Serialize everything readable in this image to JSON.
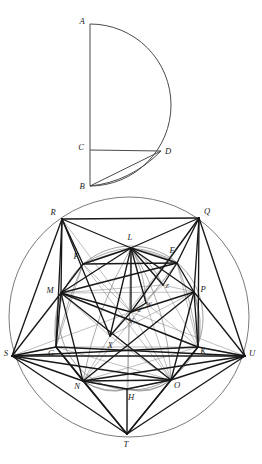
{
  "figure": {
    "colors": {
      "ink_heavy": "#1b1b1b",
      "ink_light": "#6b6b6b",
      "ink_mid": "#3a3a3a",
      "background": "#ffffff"
    }
  },
  "upper_figure": {
    "name": "semicircle-figure",
    "points": [
      {
        "id": "A",
        "label": "A",
        "x": 90,
        "y": 24,
        "label_x": 82,
        "label_y": 22
      },
      {
        "id": "C",
        "label": "C",
        "x": 90,
        "y": 150,
        "label_x": 81,
        "label_y": 148
      },
      {
        "id": "D",
        "label": "D",
        "x": 161,
        "y": 151,
        "label_x": 168,
        "label_y": 152
      },
      {
        "id": "B",
        "label": "B",
        "x": 90,
        "y": 186,
        "label_x": 82,
        "label_y": 187
      }
    ],
    "segments": [
      {
        "from": "A",
        "to": "B",
        "weight": "light"
      },
      {
        "from": "C",
        "to": "D",
        "weight": "light"
      },
      {
        "from": "B",
        "to": "D",
        "weight": "light"
      }
    ],
    "arcs": [
      {
        "name": "arc-A-to-B",
        "description": "semicircular arc from A through right extreme to B"
      },
      {
        "name": "arc-B-to-D",
        "description": "small arc from B up to D"
      }
    ]
  },
  "lower_figure": {
    "name": "circle-figure",
    "outer_circle": {
      "cx": 129,
      "cy": 317,
      "r": 120
    },
    "inner_circle": {
      "cx": 131,
      "cy": 318,
      "r": 72
    },
    "points": [
      {
        "id": "R",
        "label": "R",
        "x": 62,
        "y": 219,
        "label_x": 53,
        "label_y": 213
      },
      {
        "id": "Q",
        "label": "Q",
        "x": 199,
        "y": 218,
        "label_x": 207,
        "label_y": 212
      },
      {
        "id": "S",
        "label": "S",
        "x": 12,
        "y": 356,
        "label_x": 6,
        "label_y": 354
      },
      {
        "id": "U",
        "label": "U",
        "x": 245,
        "y": 356,
        "label_x": 251,
        "label_y": 354
      },
      {
        "id": "T",
        "label": "T",
        "x": 127,
        "y": 434,
        "label_x": 126,
        "label_y": 444
      },
      {
        "id": "L",
        "label": "L",
        "x": 131,
        "y": 248,
        "label_x": 129,
        "label_y": 238
      },
      {
        "id": "F",
        "label": "F",
        "x": 83,
        "y": 264,
        "label_x": 76,
        "label_y": 257
      },
      {
        "id": "E",
        "label": "E",
        "x": 177,
        "y": 263,
        "label_x": 170,
        "label_y": 251
      },
      {
        "id": "M",
        "label": "M",
        "x": 61,
        "y": 293,
        "label_x": 51,
        "label_y": 291
      },
      {
        "id": "P",
        "label": "P",
        "x": 194,
        "y": 292,
        "label_x": 202,
        "label_y": 290
      },
      {
        "id": "G",
        "label": "G",
        "x": 56,
        "y": 347,
        "label_x": 52,
        "label_y": 353
      },
      {
        "id": "K",
        "label": "K",
        "x": 198,
        "y": 347,
        "label_x": 201,
        "label_y": 351
      },
      {
        "id": "N",
        "label": "N",
        "x": 83,
        "y": 381,
        "label_x": 78,
        "label_y": 385
      },
      {
        "id": "O",
        "label": "O",
        "x": 171,
        "y": 380,
        "label_x": 176,
        "label_y": 385
      },
      {
        "id": "H",
        "label": "H",
        "x": 127,
        "y": 389,
        "label_x": 130,
        "label_y": 397
      },
      {
        "id": "V",
        "label": "V",
        "x": 131,
        "y": 312,
        "label_x": 131,
        "label_y": 321
      },
      {
        "id": "X",
        "label": "X",
        "x": 110,
        "y": 336,
        "label_x": 110,
        "label_y": 345
      },
      {
        "id": "W",
        "label": "W",
        "x": 146,
        "y": 303,
        "label_x": 147,
        "label_y": 305
      },
      {
        "id": "Z",
        "label": "Z",
        "x": 163,
        "y": 285,
        "label_x": 166,
        "label_y": 286
      },
      {
        "id": "a",
        "label": "a",
        "x": 139,
        "y": 309,
        "label_x": 138,
        "label_y": 310
      }
    ],
    "label_list": [
      "R",
      "Q",
      "L",
      "E",
      "F",
      "M",
      "P",
      "Z",
      "W",
      "a",
      "V",
      "X",
      "S",
      "G",
      "K",
      "U",
      "N",
      "O",
      "H",
      "T"
    ],
    "heavy_segments": [
      [
        "R",
        "Q"
      ],
      [
        "R",
        "M"
      ],
      [
        "R",
        "L"
      ],
      [
        "R",
        "F"
      ],
      [
        "R",
        "S"
      ],
      [
        "R",
        "X"
      ],
      [
        "R",
        "G"
      ],
      [
        "Q",
        "P"
      ],
      [
        "Q",
        "L"
      ],
      [
        "Q",
        "E"
      ],
      [
        "Q",
        "U"
      ],
      [
        "Q",
        "K"
      ],
      [
        "Q",
        "V"
      ],
      [
        "M",
        "S"
      ],
      [
        "M",
        "L"
      ],
      [
        "M",
        "F"
      ],
      [
        "M",
        "G"
      ],
      [
        "M",
        "N"
      ],
      [
        "M",
        "E"
      ],
      [
        "M",
        "V"
      ],
      [
        "M",
        "O"
      ],
      [
        "M",
        "K"
      ],
      [
        "P",
        "U"
      ],
      [
        "P",
        "E"
      ],
      [
        "P",
        "K"
      ],
      [
        "P",
        "O"
      ],
      [
        "P",
        "V"
      ],
      [
        "P",
        "N"
      ],
      [
        "S",
        "G"
      ],
      [
        "S",
        "N"
      ],
      [
        "S",
        "T"
      ],
      [
        "S",
        "O"
      ],
      [
        "S",
        "K"
      ],
      [
        "S",
        "U"
      ],
      [
        "U",
        "K"
      ],
      [
        "U",
        "O"
      ],
      [
        "U",
        "T"
      ],
      [
        "U",
        "N"
      ],
      [
        "U",
        "G"
      ],
      [
        "N",
        "O"
      ],
      [
        "N",
        "T"
      ],
      [
        "N",
        "H"
      ],
      [
        "O",
        "T"
      ],
      [
        "O",
        "H"
      ],
      [
        "G",
        "N"
      ],
      [
        "K",
        "O"
      ],
      [
        "L",
        "V"
      ],
      [
        "L",
        "X"
      ],
      [
        "L",
        "E"
      ],
      [
        "L",
        "F"
      ],
      [
        "L",
        "M"
      ],
      [
        "L",
        "P"
      ],
      [
        "L",
        "Z"
      ],
      [
        "L",
        "W"
      ],
      [
        "L",
        "O"
      ],
      [
        "L",
        "N"
      ],
      [
        "F",
        "E"
      ],
      [
        "E",
        "Z"
      ],
      [
        "E",
        "P"
      ],
      [
        "V",
        "X"
      ],
      [
        "V",
        "W"
      ],
      [
        "G",
        "T"
      ],
      [
        "K",
        "T"
      ],
      [
        "H",
        "T"
      ]
    ],
    "light_segments": [
      [
        "F",
        "M"
      ],
      [
        "F",
        "V"
      ],
      [
        "F",
        "G"
      ],
      [
        "E",
        "K"
      ],
      [
        "E",
        "W"
      ],
      [
        "M",
        "P"
      ],
      [
        "M",
        "Z"
      ],
      [
        "G",
        "K"
      ],
      [
        "V",
        "Z"
      ],
      [
        "V",
        "O"
      ],
      [
        "N",
        "H"
      ],
      [
        "O",
        "H"
      ],
      [
        "L",
        "H"
      ],
      [
        "L",
        "T"
      ],
      [
        "G",
        "O"
      ],
      [
        "K",
        "N"
      ],
      [
        "F",
        "O"
      ],
      [
        "E",
        "N"
      ],
      [
        "X",
        "O"
      ],
      [
        "X",
        "N"
      ],
      [
        "W",
        "O"
      ],
      [
        "W",
        "K"
      ],
      [
        "R",
        "V"
      ],
      [
        "Q",
        "X"
      ],
      [
        "S",
        "V"
      ],
      [
        "U",
        "V"
      ],
      [
        "Z",
        "K"
      ],
      [
        "Z",
        "P"
      ],
      [
        "a",
        "W"
      ],
      [
        "a",
        "V"
      ]
    ],
    "lens_arcs": [
      {
        "name": "arc-F-L",
        "desc": "thin arc bulging from F to L"
      },
      {
        "name": "arc-L-E",
        "desc": "thin arc bulging from L to E"
      },
      {
        "name": "arc-N-H",
        "desc": "thin arc bulging from N to H"
      },
      {
        "name": "arc-H-O",
        "desc": "thin arc bulging from H to O"
      },
      {
        "name": "arc-M-G",
        "desc": "thin arc bulging from M to G"
      },
      {
        "name": "arc-P-K",
        "desc": "thin arc bulging from P to K"
      }
    ]
  }
}
